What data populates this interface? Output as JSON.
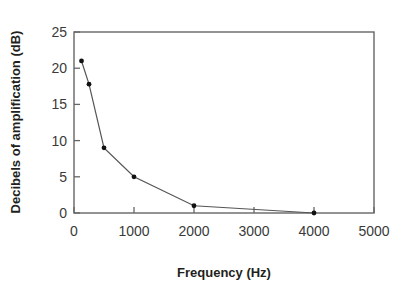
{
  "chart_data": {
    "type": "line",
    "title": "",
    "xlabel": "Frequency (Hz)",
    "ylabel": "Decibels of amplification (dB)",
    "x": [
      125,
      250,
      500,
      1000,
      2000,
      4000
    ],
    "values": [
      21,
      17.8,
      9,
      5,
      1,
      0
    ],
    "series": [
      {
        "name": "Amplification",
        "x": [
          125,
          250,
          500,
          1000,
          2000,
          4000
        ],
        "values": [
          21,
          17.8,
          9,
          5,
          1,
          0
        ]
      }
    ],
    "xlim": [
      0,
      5000
    ],
    "ylim": [
      0,
      25
    ],
    "xticks": [
      0,
      1000,
      2000,
      3000,
      4000,
      5000
    ],
    "yticks": [
      0,
      5,
      10,
      15,
      20,
      25
    ],
    "xtick_labels": [
      "0",
      "1000",
      "2000",
      "3000",
      "4000",
      "5000"
    ],
    "ytick_labels": [
      "0",
      "5",
      "10",
      "15",
      "20",
      "25"
    ],
    "grid": false,
    "legend": null,
    "marker": "filled-circle",
    "line_color": "#555555",
    "marker_color": "#111111",
    "axis_color": "#666666"
  },
  "axes": {
    "x_title": "Frequency (Hz)",
    "y_title": "Decibels of amplification (dB)"
  }
}
